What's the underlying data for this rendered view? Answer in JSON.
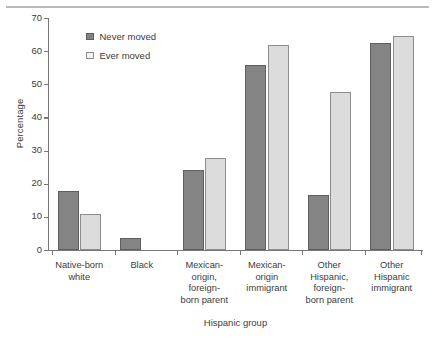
{
  "chart_data": {
    "type": "bar",
    "title": "",
    "xlabel": "Hispanic group",
    "ylabel": "Percentage",
    "ylim": [
      0,
      70
    ],
    "yticks": [
      0,
      10,
      20,
      30,
      40,
      50,
      60,
      70
    ],
    "grid": false,
    "legend_position": "top-left-inside",
    "categories": [
      "Native-born\nwhite",
      "Black",
      "Mexican-\norigin,\nforeign-\nborn parent",
      "Mexican-\norigin\nimmigrant",
      "Other\nHispanic,\nforeign-\nborn parent",
      "Other\nHispanic\nimmigrant"
    ],
    "category_lines": [
      [
        "Native-born",
        "white"
      ],
      [
        "Black"
      ],
      [
        "Mexican-",
        "origin,",
        "foreign-",
        "born parent"
      ],
      [
        "Mexican-",
        "origin",
        "immigrant"
      ],
      [
        "Other",
        "Hispanic,",
        "foreign-",
        "born parent"
      ],
      [
        "Other",
        "Hispanic",
        "immigrant"
      ]
    ],
    "series": [
      {
        "name": "Never moved",
        "color": "#848484",
        "values": [
          17.7,
          3.7,
          24.1,
          55.9,
          16.7,
          62.6
        ]
      },
      {
        "name": "Ever moved",
        "color": "#dcdcdc",
        "values": [
          10.8,
          null,
          27.8,
          61.8,
          47.7,
          64.7
        ]
      }
    ]
  },
  "legend": {
    "items": [
      {
        "label": "Never moved",
        "style": "never"
      },
      {
        "label": "Ever moved",
        "style": "ever"
      }
    ]
  },
  "axes": {
    "y_title": "Percentage",
    "x_title": "Hispanic group",
    "y_tick_labels": [
      "0",
      "10",
      "20",
      "30",
      "40",
      "50",
      "60",
      "70"
    ]
  }
}
